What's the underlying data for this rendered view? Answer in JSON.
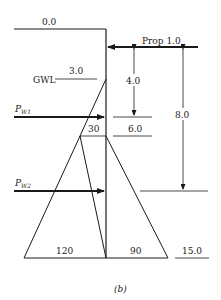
{
  "diagram": {
    "caption": "(b)",
    "levels": {
      "top": "0.0",
      "gwl_depth": "3.0",
      "excavation": "6.0",
      "toe": "15.0"
    },
    "labels": {
      "gwl": "GWL",
      "prop": "Prop 1.0",
      "pw1_main": "P",
      "pw1_sub": "W1",
      "pw2_main": "P",
      "pw2_sub": "W2"
    },
    "dimensions": {
      "prop_to_pw1": "4.0",
      "prop_to_pw2": "8.0"
    },
    "pressures": {
      "at_excavation": "30",
      "left_base": "120",
      "right_base": "90"
    }
  }
}
